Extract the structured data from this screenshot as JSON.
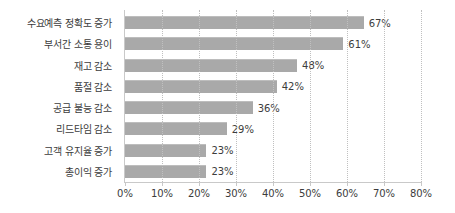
{
  "chart_data": {
    "type": "bar",
    "orientation": "horizontal",
    "title": "",
    "xlabel": "",
    "ylabel": "",
    "xlim": [
      0,
      80
    ],
    "xticks": [
      "0%",
      "10%",
      "20%",
      "30%",
      "40%",
      "50%",
      "60%",
      "70%",
      "80%"
    ],
    "xtick_values": [
      0,
      10,
      20,
      30,
      40,
      50,
      60,
      70,
      80
    ],
    "grid": "vertical-dotted",
    "legend": "none",
    "categories": [
      "수요예측 정확도 증가",
      "부서간 소통 용이",
      "재고 감소",
      "품절 감소",
      "공급 불능 감소",
      "리드타임 감소",
      "고객 유지율 증가",
      "총이익 증가"
    ],
    "values": [
      67,
      61,
      48,
      42,
      36,
      29,
      23,
      23
    ],
    "bar_lengths_pct": [
      64.5,
      59.0,
      46.5,
      41.0,
      34.5,
      27.5,
      22.0,
      22.0
    ],
    "data_labels": [
      "67%",
      "61%",
      "48%",
      "42%",
      "36%",
      "29%",
      "23%",
      "23%"
    ],
    "colors": {
      "bar": "#a9a9a9",
      "bar_top_edge": "#bdbdbd",
      "gridline": "#c0c0c0",
      "axis": "#c9c9c9",
      "text": "#3c3c3c",
      "background": "#ffffff"
    }
  }
}
